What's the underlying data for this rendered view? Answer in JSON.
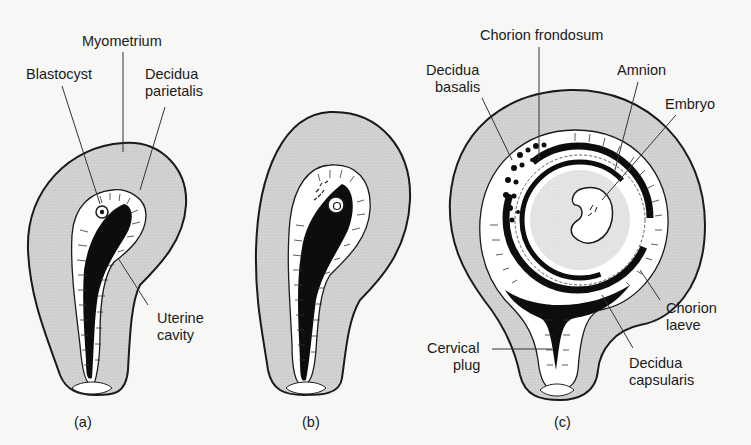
{
  "figure": {
    "type": "anatomical-diagram",
    "colors": {
      "background": "#f7f7f5",
      "myometrium_fill": "#cfcfcf",
      "decidua_fill": "#ffffff",
      "cavity_fill": "#0d0d0d",
      "outline": "#1a1a1a",
      "leader_line": "#333333"
    }
  },
  "panels": [
    {
      "id": "a",
      "caption": "(a)",
      "labels": [
        {
          "lines": [
            "Myometrium"
          ]
        },
        {
          "lines": [
            "Blastocyst"
          ]
        },
        {
          "lines": [
            "Decidua",
            "parietalis"
          ]
        },
        {
          "lines": [
            "Uterine",
            "cavity"
          ]
        }
      ]
    },
    {
      "id": "b",
      "caption": "(b)",
      "labels": []
    },
    {
      "id": "c",
      "caption": "(c)",
      "labels": [
        {
          "lines": [
            "Chorion frondosum"
          ]
        },
        {
          "lines": [
            "Decidua",
            "basalis"
          ]
        },
        {
          "lines": [
            "Amnion"
          ]
        },
        {
          "lines": [
            "Embryo"
          ]
        },
        {
          "lines": [
            "Chorion",
            "laeve"
          ]
        },
        {
          "lines": [
            "Cervical",
            "plug"
          ]
        },
        {
          "lines": [
            "Decidua",
            "capsularis"
          ]
        }
      ]
    }
  ]
}
